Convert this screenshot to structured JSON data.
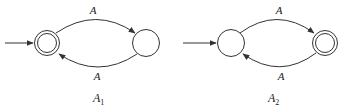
{
  "diagram": {
    "type": "finite-automata",
    "colors": {
      "stroke": "#333333",
      "text": "#222222",
      "background": "#ffffff"
    },
    "automata": [
      {
        "id": "A1",
        "caption": {
          "main": "A",
          "sub": "1"
        },
        "states": [
          {
            "id": "q0",
            "initial": true,
            "accepting": true
          },
          {
            "id": "q1",
            "initial": false,
            "accepting": false
          }
        ],
        "transitions": [
          {
            "from": "q0",
            "to": "q1",
            "label": "A"
          },
          {
            "from": "q1",
            "to": "q0",
            "label": "A"
          }
        ]
      },
      {
        "id": "A2",
        "caption": {
          "main": "A",
          "sub": "2"
        },
        "states": [
          {
            "id": "p0",
            "initial": true,
            "accepting": false
          },
          {
            "id": "p1",
            "initial": false,
            "accepting": true
          }
        ],
        "transitions": [
          {
            "from": "p0",
            "to": "p1",
            "label": "A"
          },
          {
            "from": "p1",
            "to": "p0",
            "label": "A"
          }
        ]
      }
    ]
  }
}
